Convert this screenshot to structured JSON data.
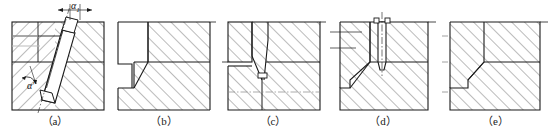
{
  "figure": {
    "width": 553,
    "height": 138,
    "background": "#ffffff",
    "line_color": "#1a1a1a",
    "hatch_color": "#555555",
    "caption_color": "#1a1a1a",
    "type": "engineering-cross-section-series",
    "panel_count": 5
  },
  "panels": [
    {
      "id": "a",
      "caption": "（a）",
      "description": "Inclined wedge slot through die block with angle annotations",
      "angles": [
        {
          "name": "alpha-1",
          "text": "α",
          "subscript": "1",
          "prime": false
        },
        {
          "name": "alpha-prime",
          "text": "α",
          "subscript": "",
          "prime": true
        }
      ]
    },
    {
      "id": "b",
      "caption": "（b）",
      "description": "Stepped notch profile with inclined relief face",
      "angles": []
    },
    {
      "id": "c",
      "caption": "（c）",
      "description": "Tapered V groove converging to narrow neck",
      "angles": []
    },
    {
      "id": "d",
      "caption": "（d）",
      "description": "Vertical punch pin seated in die with tapered tip",
      "angles": []
    },
    {
      "id": "e",
      "caption": "（e）",
      "description": "Simple stepped shoulder profile",
      "angles": []
    }
  ]
}
